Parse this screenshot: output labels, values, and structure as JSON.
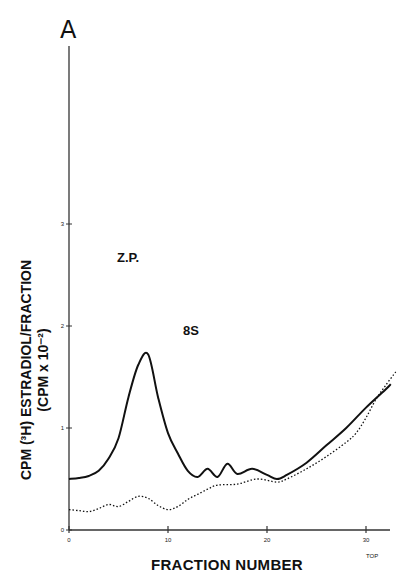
{
  "chart_data": {
    "type": "line",
    "panel_label": "A",
    "title": "",
    "xlabel": "FRACTION NUMBER",
    "ylabel_line1": "CPM (³H) ESTRADIOL/FRACTION",
    "ylabel_line2": "(CPM x 10⁻²)",
    "xlim": [
      0,
      33
    ],
    "ylim": [
      0,
      5
    ],
    "x_ticks": [
      0,
      10,
      20,
      30
    ],
    "y_ticks": [
      0,
      1,
      2,
      3
    ],
    "grid": false,
    "legend": null,
    "annotations": [
      {
        "text": "Z.P.",
        "x": 1.7,
        "y": 2.9
      },
      {
        "text": "8S",
        "x": 11.5,
        "y": 1.9
      },
      {
        "text": "TOP",
        "x": 30,
        "y": -0.25
      }
    ],
    "series": [
      {
        "name": "solid",
        "style": "solid",
        "x": [
          0,
          1,
          2,
          3,
          4,
          5,
          6,
          7,
          8,
          9,
          10,
          11,
          12,
          13,
          14,
          15,
          16,
          17,
          18.5,
          20,
          21,
          22,
          24,
          26,
          28,
          30,
          32,
          32.5
        ],
        "y": [
          0.5,
          0.51,
          0.53,
          0.58,
          0.7,
          0.9,
          1.3,
          1.62,
          1.72,
          1.3,
          0.95,
          0.75,
          0.58,
          0.52,
          0.6,
          0.52,
          0.65,
          0.55,
          0.6,
          0.54,
          0.5,
          0.54,
          0.66,
          0.83,
          1.0,
          1.2,
          1.38,
          1.43
        ]
      },
      {
        "name": "dotted",
        "style": "dotted",
        "x": [
          0,
          1,
          2,
          3,
          4,
          5,
          6,
          7,
          8,
          9,
          10,
          11,
          12,
          13,
          14,
          15,
          17,
          19,
          21,
          22,
          24,
          26,
          28,
          29,
          30,
          31,
          32,
          33
        ],
        "y": [
          0.2,
          0.19,
          0.18,
          0.21,
          0.25,
          0.23,
          0.28,
          0.33,
          0.31,
          0.24,
          0.2,
          0.23,
          0.3,
          0.35,
          0.4,
          0.44,
          0.45,
          0.5,
          0.47,
          0.5,
          0.6,
          0.72,
          0.86,
          0.95,
          1.1,
          1.28,
          1.42,
          1.55
        ]
      }
    ]
  }
}
